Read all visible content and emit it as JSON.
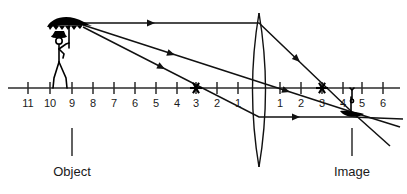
{
  "diagram": {
    "axis": {
      "label": "optical-axis",
      "y": 88,
      "x_start": 8,
      "x_end": 400,
      "unit_spacing": 21.2,
      "center_x": 259
    },
    "left_ticks": [
      {
        "label": "11",
        "x": 28
      },
      {
        "label": "10",
        "x": 50
      },
      {
        "label": "9",
        "x": 72
      },
      {
        "label": "8",
        "x": 93
      },
      {
        "label": "7",
        "x": 114
      },
      {
        "label": "6",
        "x": 135
      },
      {
        "label": "5",
        "x": 156
      },
      {
        "label": "4",
        "x": 177
      },
      {
        "label": "3",
        "x": 196
      },
      {
        "label": "2",
        "x": 217
      },
      {
        "label": "1",
        "x": 238
      }
    ],
    "right_ticks": [
      {
        "label": "1",
        "x": 280
      },
      {
        "label": "2",
        "x": 301
      },
      {
        "label": "3",
        "x": 322
      },
      {
        "label": "4",
        "x": 343
      },
      {
        "label": "5",
        "x": 362
      },
      {
        "label": "6",
        "x": 383
      }
    ],
    "lens": {
      "name": "converging-lens",
      "center_x": 259,
      "top_y": 13,
      "bottom_y": 167,
      "half_width": 13
    },
    "focal_points": [
      {
        "name": "focal-point-left",
        "x": 196,
        "y": 88,
        "tick_label": "3"
      },
      {
        "name": "focal-point-right",
        "x": 322,
        "y": 88,
        "tick_label": "3"
      }
    ],
    "object": {
      "name": "object-figure",
      "caption": "Object",
      "base_x": 72,
      "base_y": 88,
      "top_x": 83,
      "top_y": 23,
      "pointer_top_y": 128,
      "pointer_bottom_y": 156,
      "caption_y": 176
    },
    "image": {
      "name": "image-figure",
      "caption": "Image",
      "base_x": 352,
      "base_y": 88,
      "tip_x": 352,
      "tip_y": 112,
      "pointer_top_y": 128,
      "pointer_bottom_y": 156,
      "caption_y": 176
    },
    "rays": [
      {
        "name": "parallel-ray",
        "description": "parallel to axis then refracted through right focal point",
        "points": "83,23 259,23 352,112",
        "arrows": [
          {
            "x": 155,
            "y": 23,
            "angle": 0
          },
          {
            "x": 300,
            "y": 62,
            "angle": 43
          }
        ]
      },
      {
        "name": "center-ray",
        "description": "through optical center, undeviated",
        "points": "83,25 352,112",
        "arrows": [
          {
            "x": 175,
            "y": 55,
            "angle": 18
          },
          {
            "x": 290,
            "y": 92,
            "angle": 18
          }
        ]
      },
      {
        "name": "focal-ray",
        "description": "through left focal point then parallel to axis",
        "points": "83,27 259,117 352,117",
        "arrows": [
          {
            "x": 165,
            "y": 69,
            "angle": 27
          },
          {
            "x": 300,
            "y": 117,
            "angle": 0
          }
        ]
      },
      {
        "name": "extension-ray-upper",
        "description": "continuation past image point",
        "points": "352,112 400,127"
      },
      {
        "name": "extension-ray-lower",
        "description": "continuation past image point",
        "points": "352,112 390,146"
      },
      {
        "name": "extension-ray-flat",
        "description": "continuation past image point",
        "points": "352,117 403,119"
      }
    ],
    "colors": {
      "ink": "#111111",
      "axis": "#2b2b2b",
      "faint_ray": "#9a9a9a",
      "background": "#ffffff"
    }
  }
}
